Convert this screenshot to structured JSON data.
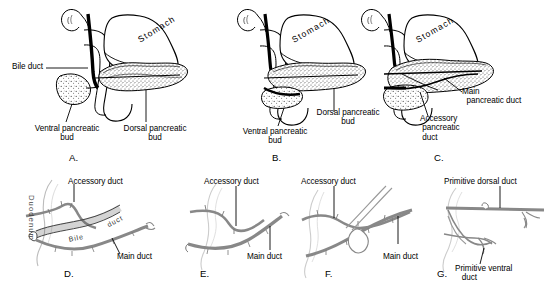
{
  "figure": {
    "background": "#ffffff",
    "ink": "#000000",
    "stipple": "#555555",
    "width": 556,
    "height": 290
  },
  "panels": [
    {
      "id": "A",
      "letter": "A.",
      "organ_label": "Stomach",
      "labels": [
        {
          "name": "bile-duct",
          "text": "Bile duct"
        },
        {
          "name": "ventral-pancreatic-bud",
          "text": "Ventral pancreatic\nbud"
        },
        {
          "name": "dorsal-pancreatic-bud",
          "text": "Dorsal pancreatic\nbud"
        }
      ]
    },
    {
      "id": "B",
      "letter": "B.",
      "organ_label": "Stomach",
      "labels": [
        {
          "name": "dorsal-pancreatic-bud",
          "text": "Dorsal pancreatic\nbud"
        },
        {
          "name": "ventral-pancreatic-bud",
          "text": "Ventral pancreatic\nbud"
        }
      ]
    },
    {
      "id": "C",
      "letter": "C.",
      "organ_label": "Stomach",
      "labels": [
        {
          "name": "main-pancreatic-duct",
          "text": "Main\n  pancreatic duct"
        },
        {
          "name": "accessory-pancreatic-duct",
          "text": "Accessory\n pancreatic\n duct"
        }
      ]
    },
    {
      "id": "D",
      "letter": "D.",
      "labels": [
        {
          "name": "accessory-duct",
          "text": "Accessory duct"
        },
        {
          "name": "main-duct",
          "text": "Main duct"
        },
        {
          "name": "duodenum",
          "text": "Duodenum"
        },
        {
          "name": "bile-duct-curved",
          "text": "Bile"
        },
        {
          "name": "bile-duct-curved-2",
          "text": "duct"
        }
      ]
    },
    {
      "id": "E",
      "letter": "E.",
      "labels": [
        {
          "name": "accessory-duct",
          "text": "Accessory duct"
        },
        {
          "name": "main-duct",
          "text": "Main duct"
        }
      ]
    },
    {
      "id": "F",
      "letter": "F.",
      "labels": [
        {
          "name": "accessory-duct",
          "text": "Accessory duct"
        },
        {
          "name": "main-duct",
          "text": "Main duct"
        }
      ]
    },
    {
      "id": "G",
      "letter": "G.",
      "labels": [
        {
          "name": "primitive-dorsal-duct",
          "text": "Primitive dorsal duct"
        },
        {
          "name": "primitive-ventral-duct",
          "text": "Primitive ventral\n   duct"
        }
      ]
    }
  ]
}
